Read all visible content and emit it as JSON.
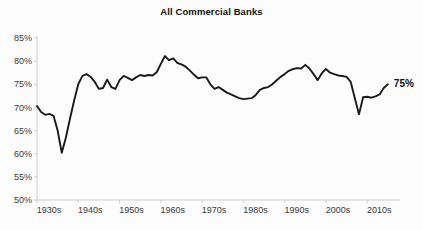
{
  "chart_data": {
    "type": "line",
    "title": "All Commercial Banks",
    "xlabel": "",
    "ylabel": "",
    "xlim": [
      1930,
      2016
    ],
    "ylim": [
      50,
      85
    ],
    "grid": false,
    "legend": null,
    "y_tick_labels": [
      "85%",
      "80%",
      "75%",
      "70%",
      "65%",
      "60%",
      "55%",
      "50%"
    ],
    "y_tick_values": [
      85,
      80,
      75,
      70,
      65,
      60,
      55,
      50
    ],
    "x_tick_labels": [
      "1930s",
      "1940s",
      "1950s",
      "1960s",
      "1970s",
      "1980s",
      "1990s",
      "2000s",
      "2010s"
    ],
    "x_tick_values": [
      1930,
      1940,
      1950,
      1960,
      1970,
      1980,
      1990,
      2000,
      2010
    ],
    "annotations": [
      {
        "text": "75%",
        "x": 2015,
        "y": 75
      }
    ],
    "series": [
      {
        "name": "All Commercial Banks",
        "x": [
          1930,
          1931,
          1932,
          1933,
          1934,
          1935,
          1936,
          1937,
          1938,
          1939,
          1940,
          1941,
          1942,
          1943,
          1944,
          1945,
          1946,
          1947,
          1948,
          1949,
          1950,
          1951,
          1952,
          1953,
          1954,
          1955,
          1956,
          1957,
          1958,
          1959,
          1960,
          1961,
          1962,
          1963,
          1964,
          1965,
          1966,
          1967,
          1968,
          1969,
          1970,
          1971,
          1972,
          1973,
          1974,
          1975,
          1976,
          1977,
          1978,
          1979,
          1980,
          1981,
          1982,
          1983,
          1984,
          1985,
          1986,
          1987,
          1988,
          1989,
          1990,
          1991,
          1992,
          1993,
          1994,
          1995,
          1996,
          1997,
          1998,
          1999,
          2000,
          2001,
          2002,
          2003,
          2004,
          2005,
          2006,
          2007,
          2008,
          2009,
          2010,
          2011,
          2012,
          2013,
          2014,
          2015
        ],
        "values": [
          70.3,
          69.0,
          68.4,
          68.6,
          68.2,
          65.0,
          60.2,
          63.5,
          67.6,
          71.5,
          75.0,
          76.8,
          77.2,
          76.6,
          75.5,
          74.0,
          74.2,
          76.0,
          74.4,
          74.0,
          75.9,
          76.8,
          76.4,
          75.9,
          76.5,
          77.0,
          76.8,
          77.0,
          76.9,
          77.6,
          79.4,
          81.1,
          80.2,
          80.6,
          79.6,
          79.3,
          78.8,
          78.0,
          77.1,
          76.3,
          76.5,
          76.5,
          75.0,
          74.0,
          74.4,
          73.8,
          73.2,
          72.8,
          72.4,
          72.0,
          71.8,
          71.9,
          72.0,
          72.7,
          73.8,
          74.2,
          74.4,
          75.0,
          75.8,
          76.6,
          77.2,
          77.9,
          78.3,
          78.5,
          78.4,
          79.2,
          78.4,
          77.2,
          75.9,
          77.4,
          78.3,
          77.5,
          77.2,
          76.9,
          76.8,
          76.6,
          75.5,
          72.0,
          68.5,
          72.2,
          72.3,
          72.1,
          72.4,
          72.8,
          74.2,
          75.0
        ]
      }
    ]
  }
}
